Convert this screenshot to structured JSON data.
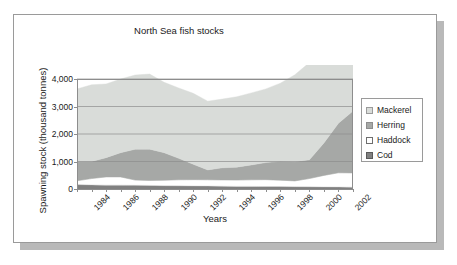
{
  "figure": {
    "title": "North Sea fish stocks",
    "x_axis_title": "Years",
    "y_axis_title": "Spawning stock (thousand tonnes)"
  },
  "legend": {
    "items": [
      {
        "label": "Mackerel",
        "color": "#d9dcd9",
        "swatch_border": "#9a9a9a"
      },
      {
        "label": "Herring",
        "color": "#a6a8a6",
        "swatch_border": "#8d8d8d"
      },
      {
        "label": "Haddock",
        "color": "#ffffff",
        "swatch_border": "#6e6e6e"
      },
      {
        "label": "Cod",
        "color": "#808080",
        "swatch_border": "#5a5a5a"
      }
    ]
  },
  "chart_data": {
    "type": "area",
    "stacked": true,
    "title": "North Sea fish stocks",
    "xlabel": "Years",
    "ylabel": "Spawning stock (thousand tonnes)",
    "grid": true,
    "legend_position": "right",
    "xlim": [
      1984,
      2003
    ],
    "ylim": [
      0,
      4000
    ],
    "yticks": [
      0,
      1000,
      2000,
      3000,
      4000
    ],
    "ytick_labels": [
      "0",
      "1,000",
      "2,000",
      "3,000",
      "4,000"
    ],
    "xticks": [
      1984,
      1986,
      1988,
      1990,
      1992,
      1994,
      1996,
      1998,
      2000,
      2002
    ],
    "xtick_labels": [
      "1984",
      "1986",
      "1988",
      "1990",
      "1992",
      "1994",
      "1996",
      "1998",
      "2000",
      "2002"
    ],
    "x": [
      1984,
      1985,
      1986,
      1987,
      1988,
      1989,
      1990,
      1991,
      1992,
      1993,
      1994,
      1995,
      1996,
      1997,
      1998,
      1999,
      2000,
      2001,
      2002,
      2003
    ],
    "series": [
      {
        "name": "Cod",
        "color": "#808080",
        "values": [
          160,
          150,
          140,
          140,
          135,
          130,
          120,
          115,
          110,
          105,
          100,
          95,
          95,
          90,
          90,
          85,
          80,
          75,
          70,
          65
        ]
      },
      {
        "name": "Haddock",
        "color": "#ffffff",
        "values": [
          140,
          230,
          300,
          300,
          190,
          180,
          200,
          220,
          230,
          230,
          230,
          230,
          240,
          250,
          230,
          210,
          300,
          420,
          520,
          520
        ]
      },
      {
        "name": "Herring",
        "color": "#a6a8a6",
        "values": [
          700,
          620,
          700,
          880,
          1120,
          1140,
          1000,
          780,
          560,
          360,
          440,
          470,
          540,
          620,
          690,
          700,
          680,
          1180,
          1800,
          2250
        ]
      },
      {
        "name": "Mackerel",
        "color": "#d9dcd9",
        "values": [
          2640,
          2790,
          2680,
          2680,
          2700,
          2730,
          2560,
          2560,
          2580,
          2500,
          2500,
          2560,
          2620,
          2680,
          2840,
          3160,
          3540,
          3800,
          4100,
          4400
        ]
      }
    ],
    "totals": [
      3640,
      3790,
      3820,
      4000,
      4145,
      4180,
      3880,
      3675,
      3480,
      3195,
      3270,
      3355,
      3495,
      3640,
      3850,
      4155,
      4600,
      5475,
      6490,
      7235
    ]
  }
}
